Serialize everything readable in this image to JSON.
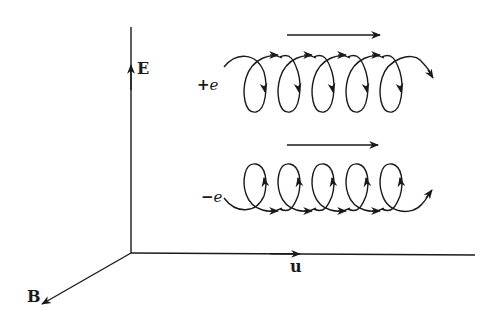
{
  "figure": {
    "axes": {
      "E": {
        "label": "E",
        "direction": "up"
      },
      "u": {
        "label": "u",
        "direction": "right"
      },
      "B": {
        "label": "B",
        "direction": "out-of-page (down-left)"
      }
    },
    "particles": [
      {
        "id": "positive",
        "label_sign": "+",
        "label_symbol": "e",
        "drift_direction": "right",
        "gyration": "clockwise (loops below guiding center)"
      },
      {
        "id": "negative",
        "label_sign": "−",
        "label_symbol": "e",
        "drift_direction": "right",
        "gyration": "counter-clockwise (loops above guiding center)"
      }
    ],
    "colors": {
      "ink": "#1a1a1a",
      "background": "#ffffff"
    }
  }
}
